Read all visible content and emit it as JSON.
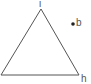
{
  "diagram": {
    "type": "geometry",
    "shape": "triangle",
    "stroke_color": "#555555",
    "vertices": [
      {
        "name": "i",
        "x": 41,
        "y": 9
      },
      {
        "name": "",
        "x": 1,
        "y": 75
      },
      {
        "name": "h",
        "x": 79,
        "y": 75
      }
    ],
    "labels": {
      "apex": "i",
      "bottom_right": "h",
      "point": "b"
    },
    "points": [
      {
        "name": "b",
        "x": 73,
        "y": 24,
        "color": "#222222"
      }
    ]
  }
}
